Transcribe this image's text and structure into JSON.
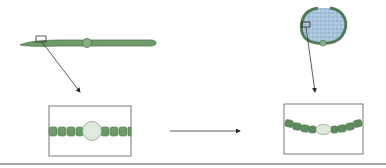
{
  "diagram": {
    "type": "biology-illustration",
    "panels": [
      {
        "id": "left-filament",
        "description": "Straight green filament with central swelling, small rectangle marking zoom region"
      },
      {
        "id": "right-colony",
        "description": "Round gelatinous colony with blue-speckled interior and green filament rim, small rectangle marking zoom region"
      },
      {
        "id": "left-inset",
        "description": "Magnified straight chain of green cells with large pale round heterocyst"
      },
      {
        "id": "right-inset",
        "description": "Magnified curved chain of green cells with small pale oval heterocyst"
      }
    ],
    "arrows": [
      {
        "from": "left-filament",
        "to": "left-inset"
      },
      {
        "from": "right-colony",
        "to": "right-inset"
      },
      {
        "from": "left-inset",
        "to": "right-inset"
      }
    ],
    "colors": {
      "cell_green": "#6f9a6a",
      "cell_dark": "#4f7a52",
      "heterocyst": "#dfe9dc",
      "colony_fill": "#a9c3dc",
      "line": "#333333",
      "baseline": "#888888"
    }
  }
}
